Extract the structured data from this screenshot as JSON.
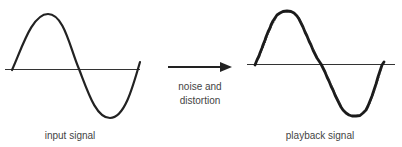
{
  "diagram": {
    "input": {
      "label": "input signal",
      "stroke_color": "#222222",
      "axis_color": "#333333"
    },
    "transform": {
      "label_line1": "noise and",
      "label_line2": "distortion",
      "arrow_color": "#222222"
    },
    "output": {
      "label": "playback signal",
      "stroke_color": "#1a1a1a",
      "axis_color": "#333333"
    }
  }
}
